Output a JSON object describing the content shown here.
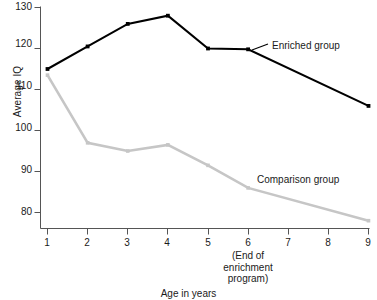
{
  "chart_data": {
    "type": "line",
    "title": "",
    "xlabel": "Age in years",
    "ylabel": "Average IQ",
    "x": [
      1,
      2,
      3,
      4,
      5,
      6,
      7,
      8,
      9
    ],
    "xlim": [
      1,
      9
    ],
    "ylim": [
      76,
      130
    ],
    "xticks": [
      "1",
      "2",
      "3",
      "4",
      "5",
      "6",
      "7",
      "8",
      "9"
    ],
    "yticks": [
      "80",
      "90",
      "100",
      "110",
      "120",
      "130"
    ],
    "grid": false,
    "legend_position": "inline-right",
    "series": [
      {
        "name": "Enriched group",
        "color": "#000000",
        "marker": "square",
        "marker_x": [
          1,
          2,
          3,
          4,
          5,
          6,
          9
        ],
        "values": [
          115,
          120.5,
          126,
          128,
          120,
          119.8,
          null,
          null,
          106
        ]
      },
      {
        "name": "Comparison group",
        "color": "#c6c6c6",
        "marker": "square",
        "marker_x": [
          1,
          2,
          3,
          4,
          5,
          6,
          9
        ],
        "values": [
          113.5,
          97,
          95,
          96.5,
          91.5,
          86,
          null,
          null,
          78
        ]
      }
    ],
    "annotations": [
      {
        "text": "(End of\nenrichment\nprogram)",
        "lines": [
          "(End of",
          "enrichment",
          "program)"
        ],
        "at_x": 6,
        "position": "below-axis"
      }
    ]
  },
  "labels": {
    "y_axis_title": "Average IQ",
    "x_axis_title": "Age in years",
    "enriched_group": "Enriched group",
    "comparison_group": "Comparison group",
    "annotation_line1": "(End of",
    "annotation_line2": "enrichment",
    "annotation_line3": "program)"
  },
  "ytick_values": [
    "130",
    "120",
    "110",
    "100",
    "90",
    "80"
  ],
  "xtick_values": [
    "1",
    "2",
    "3",
    "4",
    "5",
    "6",
    "7",
    "8",
    "9"
  ],
  "colors": {
    "enriched": "#000000",
    "comparison": "#c6c6c6",
    "axis": "#555555",
    "text": "#1a1a1a"
  }
}
